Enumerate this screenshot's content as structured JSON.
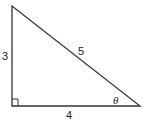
{
  "diagram": {
    "type": "right-triangle",
    "sides": {
      "vertical": "3",
      "hypotenuse": "5",
      "horizontal": "4"
    },
    "angle_label": "θ",
    "right_angle_marker": true,
    "stroke_color": "#333333"
  }
}
